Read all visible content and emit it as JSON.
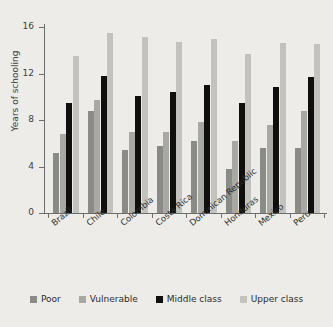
{
  "chart_data": {
    "type": "bar",
    "title": "",
    "xlabel": "",
    "ylabel": "Years of schooling",
    "ylim": [
      0,
      16
    ],
    "yticks": [
      0,
      4,
      8,
      12,
      16
    ],
    "grid": false,
    "legend_position": "bottom",
    "categories": [
      "Brazil",
      "Chile",
      "Colombia",
      "Costa Rica",
      "Dominican Republic",
      "Honduras",
      "Mexico",
      "Peru"
    ],
    "series": [
      {
        "name": "Poor",
        "color": "#8a8a86",
        "values": [
          5.2,
          8.8,
          5.4,
          5.8,
          6.2,
          3.8,
          5.6,
          5.6
        ]
      },
      {
        "name": "Vulnerable",
        "color": "#a9a9a4",
        "values": [
          6.8,
          9.7,
          7.0,
          7.0,
          7.8,
          6.2,
          7.6,
          8.8
        ]
      },
      {
        "name": "Middle class",
        "color": "#100f0d",
        "values": [
          9.5,
          11.8,
          10.1,
          10.4,
          11.0,
          9.5,
          10.8,
          11.7
        ]
      },
      {
        "name": "Upper class",
        "color": "#c3c3be",
        "values": [
          13.5,
          15.5,
          15.1,
          14.7,
          15.0,
          13.7,
          14.6,
          14.5
        ]
      }
    ]
  },
  "axis": {
    "y_label": "Years of schooling",
    "y_tick_labels": [
      "0",
      "4",
      "8",
      "12",
      "16"
    ]
  },
  "legend": {
    "items": [
      {
        "label": "Poor",
        "color": "#8a8a86"
      },
      {
        "label": "Vulnerable",
        "color": "#a9a9a4"
      },
      {
        "label": "Middle class",
        "color": "#100f0d"
      },
      {
        "label": "Upper class",
        "color": "#c3c3be"
      }
    ]
  }
}
